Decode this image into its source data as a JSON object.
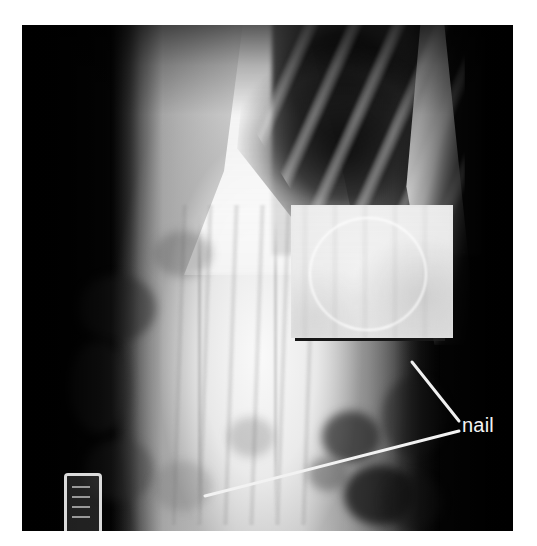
{
  "figure": {
    "kind": "radiograph",
    "modality": "X-ray",
    "view": "abdominal / lower-chest frontal projection",
    "background_color": "#ffffff",
    "film_color": "#050505",
    "frame": {
      "left": 22,
      "top": 25,
      "width": 491,
      "height": 506
    }
  },
  "annotations": {
    "nail_label": "nail",
    "label_color": "#f4f4f4",
    "leader_lines": [
      {
        "name": "leader-from-inset",
        "from": {
          "x": 459,
          "y": 423
        },
        "to": {
          "x": 412,
          "y": 363
        },
        "color": "#f0f0f0"
      },
      {
        "name": "leader-to-nail-on-film",
        "from": {
          "x": 459,
          "y": 430
        },
        "to": {
          "x": 205,
          "y": 496
        },
        "color": "#f2f2f2"
      }
    ]
  },
  "inset": {
    "name": "magnified-detail",
    "description": "magnified crop showing the circular outline of the swallowed nail",
    "rect": {
      "left": 291,
      "top": 205,
      "width": 162,
      "height": 133
    },
    "background_color": "#ebebeb",
    "circle_outline_color": "#ffffff",
    "underbar_color": "#101010"
  },
  "film_marker": {
    "name": "film-side-marker",
    "description": "bright rectangular radio-opaque marker at lower-left of the film",
    "rect": {
      "left": 42,
      "top": 448,
      "width": 32,
      "height": 56
    },
    "color": "#f5f5f5"
  },
  "caption": {
    "text": "",
    "note": "caption text is cropped off at the bottom edge and illegible"
  },
  "anatomy_regions": [
    {
      "name": "lung-field-dark",
      "tone": "dark",
      "location": "upper right"
    },
    {
      "name": "rib-cage",
      "tone": "bright diagonal bands",
      "location": "upper right"
    },
    {
      "name": "chest-wall-stripe",
      "tone": "bright",
      "location": "right lateral"
    },
    {
      "name": "spine-column",
      "tone": "bright with vertical striations",
      "location": "center"
    },
    {
      "name": "bowel-gas",
      "tone": "dark mottled",
      "location": "lower left and lower right"
    }
  ]
}
